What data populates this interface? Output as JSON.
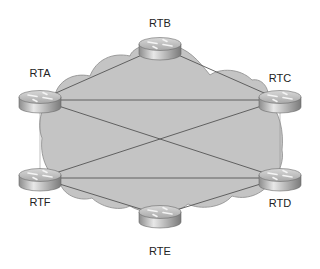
{
  "diagram": {
    "type": "network-topology",
    "cloud": {
      "fill": "#c4c4c4",
      "stroke": "#8a8a8a"
    },
    "link_color": "#555555",
    "routers": [
      {
        "id": "RTA",
        "label": "RTA",
        "x": 40,
        "y": 100,
        "label_x": 20,
        "label_y": 67
      },
      {
        "id": "RTB",
        "label": "RTB",
        "x": 160,
        "y": 47,
        "label_x": 140,
        "label_y": 17
      },
      {
        "id": "RTC",
        "label": "RTC",
        "x": 280,
        "y": 100,
        "label_x": 260,
        "label_y": 72
      },
      {
        "id": "RTD",
        "label": "RTD",
        "x": 280,
        "y": 178,
        "label_x": 260,
        "label_y": 197
      },
      {
        "id": "RTE",
        "label": "RTE",
        "x": 160,
        "y": 215,
        "label_x": 140,
        "label_y": 245
      },
      {
        "id": "RTF",
        "label": "RTF",
        "x": 40,
        "y": 178,
        "label_x": 20,
        "label_y": 196
      }
    ],
    "links": [
      {
        "from": "RTA",
        "to": "RTB"
      },
      {
        "from": "RTB",
        "to": "RTC"
      },
      {
        "from": "RTA",
        "to": "RTC"
      },
      {
        "from": "RTA",
        "to": "RTD"
      },
      {
        "from": "RTC",
        "to": "RTF"
      },
      {
        "from": "RTF",
        "to": "RTD"
      },
      {
        "from": "RTF",
        "to": "RTE"
      },
      {
        "from": "RTE",
        "to": "RTD"
      },
      {
        "from": "RTA",
        "to": "RTF",
        "style": "thin"
      },
      {
        "from": "RTC",
        "to": "RTD",
        "style": "thin"
      }
    ]
  }
}
